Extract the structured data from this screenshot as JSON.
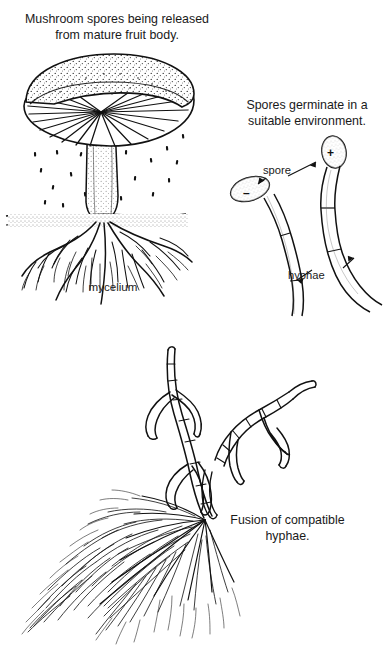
{
  "figure": {
    "title_release": "Mushroom spores being released\nfrom mature fruit body.",
    "title_germinate": "Spores germinate in a\nsuitable environment.",
    "title_fusion": "Fusion of compatible\nhyphae.",
    "label_mycelium": "mycelium",
    "label_spore": "spore",
    "label_hyphae": "hyphae",
    "sign_minus": "–",
    "sign_plus": "+",
    "colors": {
      "background": "#ffffff",
      "ink": "#111111",
      "stipple": "#333333"
    }
  }
}
